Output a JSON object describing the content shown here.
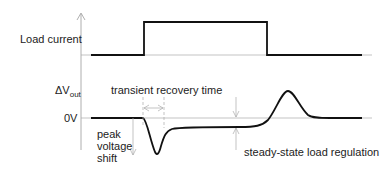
{
  "labels": {
    "load_current": "Load current",
    "delta_v": "ΔV",
    "delta_v_sub": "out",
    "zero_v": "0V",
    "transient_recovery": "transient recovery time",
    "peak_line1": "peak",
    "peak_line2": "voltage",
    "peak_line3": "shift",
    "steady_state": "steady-state load regulation"
  },
  "colors": {
    "signal": "#111111",
    "axis": "#999999",
    "annotation": "#999999"
  }
}
